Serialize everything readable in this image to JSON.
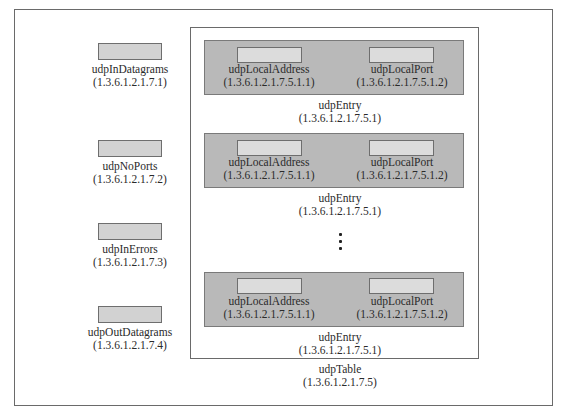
{
  "diagram": {
    "scalars": [
      {
        "name": "udpInDatagrams",
        "oid": "(1.3.6.1.2.1.7.1)"
      },
      {
        "name": "udpNoPorts",
        "oid": "(1.3.6.1.2.1.7.2)"
      },
      {
        "name": "udpInErrors",
        "oid": "(1.3.6.1.2.1.7.3)"
      },
      {
        "name": "udpOutDatagrams",
        "oid": "(1.3.6.1.2.1.7.4)"
      }
    ],
    "table": {
      "name": "udpTable",
      "oid": "(1.3.6.1.2.1.7.5)",
      "entries": [
        {
          "name": "udpEntry",
          "oid": "(1.3.6.1.2.1.7.5.1)",
          "fields": [
            {
              "name": "udpLocalAddress",
              "oid": "(1.3.6.1.2.1.7.5.1.1)"
            },
            {
              "name": "udpLocalPort",
              "oid": "(1.3.6.1.2.1.7.5.1.2)"
            }
          ]
        },
        {
          "name": "udpEntry",
          "oid": "(1.3.6.1.2.1.7.5.1)",
          "fields": [
            {
              "name": "udpLocalAddress",
              "oid": "(1.3.6.1.2.1.7.5.1.1)"
            },
            {
              "name": "udpLocalPort",
              "oid": "(1.3.6.1.2.1.7.5.1.2)"
            }
          ]
        },
        {
          "name": "udpEntry",
          "oid": "(1.3.6.1.2.1.7.5.1)",
          "fields": [
            {
              "name": "udpLocalAddress",
              "oid": "(1.3.6.1.2.1.7.5.1.1)"
            },
            {
              "name": "udpLocalPort",
              "oid": "(1.3.6.1.2.1.7.5.1.2)"
            }
          ]
        }
      ],
      "ellipsis": "vertical-ellipsis"
    },
    "colors": {
      "entry_fill": "#b9b9b9",
      "field_fill": "#dcdcdc",
      "scalar_fill": "#d2d2d2",
      "border": "#6a6a6a"
    }
  }
}
